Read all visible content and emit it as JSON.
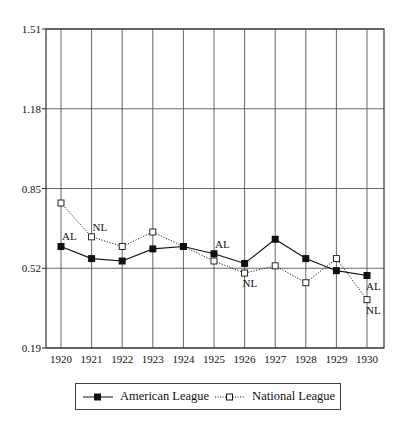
{
  "chart_data": {
    "type": "line",
    "title": "",
    "xlabel": "",
    "ylabel": "",
    "x": [
      1920,
      1921,
      1922,
      1923,
      1924,
      1925,
      1926,
      1927,
      1928,
      1929,
      1930
    ],
    "yticks": [
      "0.19",
      "0.52",
      "0.85",
      "1.18",
      "1.51"
    ],
    "ylim": [
      0.19,
      1.51
    ],
    "grid": true,
    "legend_position": "bottom",
    "series": [
      {
        "name": "American League",
        "abbr": "AL",
        "marker": "filled-square",
        "line": "solid",
        "color": "#111111",
        "values": [
          0.61,
          0.56,
          0.55,
          0.6,
          0.61,
          0.58,
          0.54,
          0.64,
          0.56,
          0.51,
          0.49
        ]
      },
      {
        "name": "National League",
        "abbr": "NL",
        "marker": "open-square",
        "line": "dotted",
        "color": "#111111",
        "values": [
          0.79,
          0.65,
          0.61,
          0.67,
          0.61,
          0.55,
          0.5,
          0.53,
          0.46,
          0.56,
          0.39
        ]
      }
    ],
    "annotations": [
      {
        "text": "AL",
        "x": 1920,
        "series": "American League"
      },
      {
        "text": "NL",
        "x": 1921,
        "series": "National League"
      },
      {
        "text": "AL",
        "x": 1925,
        "series": "American League"
      },
      {
        "text": "NL",
        "x": 1926,
        "series": "National League"
      },
      {
        "text": "AL",
        "x": 1930,
        "series": "American League"
      },
      {
        "text": "NL",
        "x": 1930,
        "series": "National League"
      }
    ]
  },
  "legend": {
    "items": [
      {
        "label": "American League"
      },
      {
        "label": "National League"
      }
    ]
  }
}
